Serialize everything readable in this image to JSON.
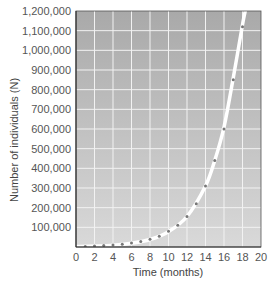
{
  "chart_data": {
    "type": "line",
    "title": "",
    "xlabel": "Time (months)",
    "ylabel": "Number of individuals (N)",
    "xlim": [
      0,
      20
    ],
    "ylim": [
      0,
      1200000
    ],
    "grid": true,
    "legend": "none",
    "x_ticks": [
      0,
      2,
      4,
      6,
      8,
      10,
      12,
      14,
      16,
      18,
      20
    ],
    "x_tick_labels": [
      "0",
      "2",
      "4",
      "6",
      "8",
      "10",
      "12",
      "14",
      "16",
      "18",
      "20"
    ],
    "y_ticks": [
      100000,
      200000,
      300000,
      400000,
      500000,
      600000,
      700000,
      800000,
      900000,
      1000000,
      1100000,
      1200000
    ],
    "y_tick_labels": [
      "100,000",
      "200,000",
      "300,000",
      "400,000",
      "500,000",
      "600,000",
      "700,000",
      "800,000",
      "900,000",
      "1,000,000",
      "1,100,000",
      "1,200,000"
    ],
    "series": [
      {
        "name": "Observed population (dots)",
        "style": "scatter",
        "x": [
          1,
          2,
          3,
          4,
          5,
          6,
          7,
          8,
          9,
          10,
          11,
          12,
          13,
          14,
          15,
          16,
          17,
          18
        ],
        "values": [
          3000,
          5000,
          7000,
          10000,
          14000,
          20000,
          28000,
          40000,
          55000,
          80000,
          110000,
          155000,
          220000,
          310000,
          440000,
          600000,
          850000,
          1120000
        ]
      },
      {
        "name": "Exponential growth curve",
        "style": "line",
        "x": [
          0,
          2,
          4,
          6,
          8,
          10,
          12,
          14,
          15,
          16,
          17,
          18,
          18.3
        ],
        "values": [
          2000,
          4500,
          9000,
          19000,
          38000,
          78000,
          155000,
          310000,
          440000,
          610000,
          860000,
          1130000,
          1200000
        ]
      }
    ],
    "colors": {
      "plot_background_top": "#a9a9a9",
      "plot_background_bottom": "#d9d9d9",
      "grid": "#f2f2f2",
      "curve": "#ffffff",
      "dots": "#777777",
      "frame": "#555555"
    }
  }
}
